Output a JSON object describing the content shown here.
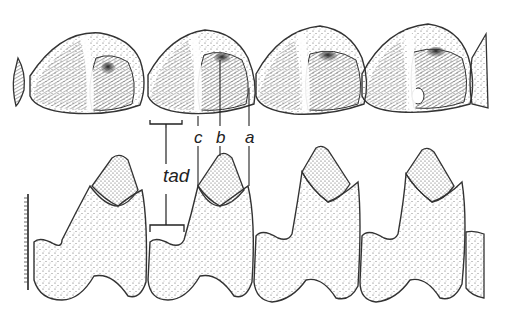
{
  "figure": {
    "labels": {
      "tad": "tad",
      "c": "c",
      "b": "b",
      "a": "a"
    },
    "occlusal_teeth_count": 4,
    "lateral_teeth_count": 4,
    "colors": {
      "ink": "#333333",
      "stipple": "#555555",
      "dark_shading": "#3a3a3a",
      "background": "#ffffff"
    }
  }
}
